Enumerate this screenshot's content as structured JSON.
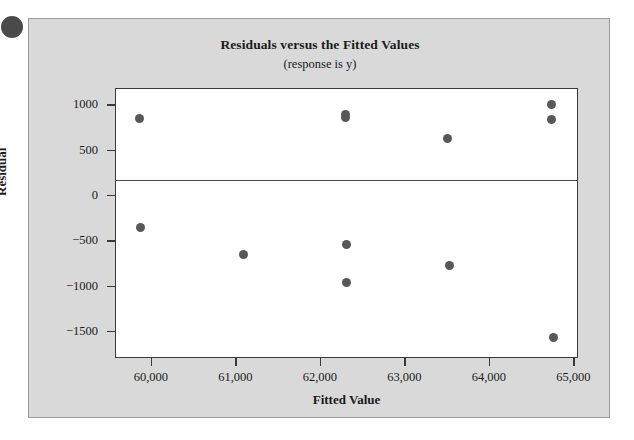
{
  "figure": {
    "bullet_icon": "filled-circle-bullet",
    "background_color": "#d9d9d9",
    "plot_background_color": "#ffffff",
    "marker_color": "#58585a",
    "axis_color": "#3a3a3a"
  },
  "chart_data": {
    "type": "scatter",
    "title": "Residuals versus the Fitted Values",
    "subtitle": "(response is y)",
    "xlabel": "Fitted Value",
    "ylabel": "Residual",
    "xlim": [
      59575,
      65055
    ],
    "ylim": [
      -1800,
      1180
    ],
    "xticks": [
      60000,
      61000,
      62000,
      63000,
      64000,
      65000
    ],
    "xtick_labels": [
      "60,000",
      "61,000",
      "62,000",
      "63,000",
      "64,000",
      "65,000"
    ],
    "yticks": [
      1000,
      500,
      0,
      -500,
      -1000,
      -1500
    ],
    "ytick_labels": [
      "1000",
      "500",
      "0",
      "−500",
      "−1000",
      "−1500"
    ],
    "grid": false,
    "legend": null,
    "reference_line": {
      "axis": "y",
      "value": 0
    },
    "points": [
      {
        "x": 59860,
        "y": 840
      },
      {
        "x": 59875,
        "y": -355
      },
      {
        "x": 61090,
        "y": -660
      },
      {
        "x": 62300,
        "y": 890
      },
      {
        "x": 62300,
        "y": 855
      },
      {
        "x": 62320,
        "y": -550
      },
      {
        "x": 62320,
        "y": -965
      },
      {
        "x": 63510,
        "y": 620
      },
      {
        "x": 63540,
        "y": -780
      },
      {
        "x": 64740,
        "y": 1000
      },
      {
        "x": 64740,
        "y": 830
      },
      {
        "x": 64760,
        "y": -1570
      }
    ]
  }
}
